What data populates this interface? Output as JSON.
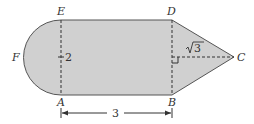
{
  "diagram": {
    "type": "composite-figure",
    "fill_color": "#d0d0d0",
    "stroke_color": "#555555",
    "points": {
      "A": "A",
      "B": "B",
      "C": "C",
      "D": "D",
      "E": "E",
      "F": "F"
    },
    "measurements": {
      "AE_label": "2",
      "AB_label": "3",
      "height_to_C_label": "√3",
      "sqrt_radicand": "3"
    },
    "right_angle_marker": true
  }
}
